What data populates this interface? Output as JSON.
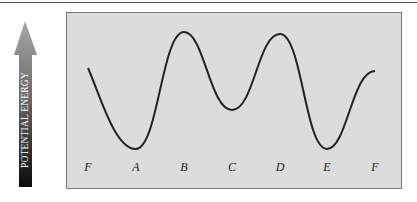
{
  "axis": {
    "label": "POTENTIAL ENERGY",
    "direction": "up"
  },
  "points": [
    {
      "id": "F1",
      "label": "F",
      "x": 88
    },
    {
      "id": "A",
      "label": "A",
      "x": 136
    },
    {
      "id": "B",
      "label": "B",
      "x": 184
    },
    {
      "id": "C",
      "label": "C",
      "x": 232
    },
    {
      "id": "D",
      "label": "D",
      "x": 280
    },
    {
      "id": "E",
      "label": "E",
      "x": 327
    },
    {
      "id": "F2",
      "label": "F",
      "x": 375
    }
  ],
  "curve": {
    "description": "Potential energy curve: F medium-high, A minimum, B maximum, C intermediate minimum, D maximum, E minimum, F medium-high",
    "relative_levels": {
      "F": "mid-high",
      "A": "low",
      "B": "high",
      "C": "mid",
      "D": "high",
      "E": "low"
    }
  }
}
